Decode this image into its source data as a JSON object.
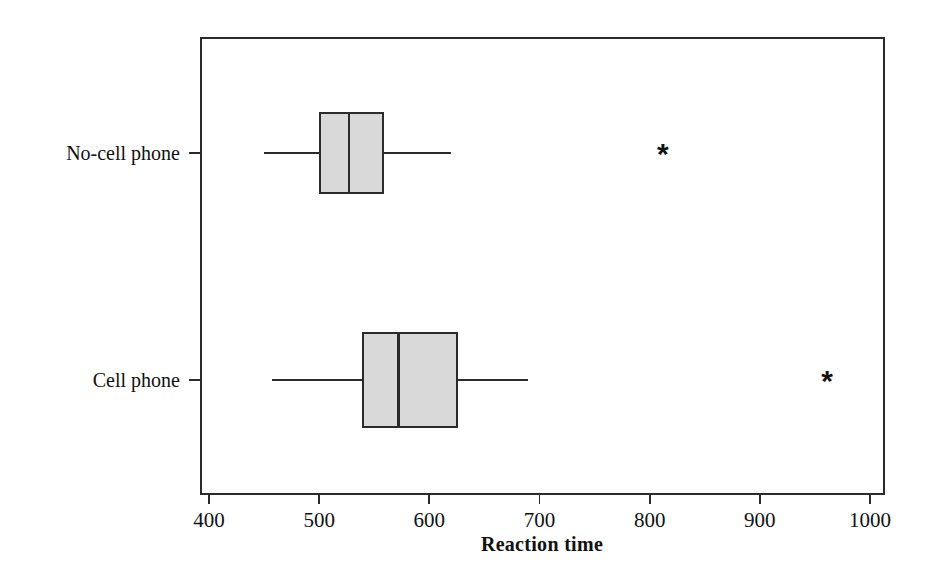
{
  "figure": {
    "background_color": "#ffffff",
    "box_fill_color": "#d9d9d9",
    "line_color": "#2b2b2b",
    "plot_frame": {
      "left": 201,
      "right": 884,
      "top": 38,
      "bottom": 494
    }
  },
  "axis": {
    "x_title": "Reaction time",
    "x_ticks": [
      "400",
      "500",
      "600",
      "700",
      "800",
      "900",
      "1000"
    ],
    "x_tick_values": [
      400,
      500,
      600,
      700,
      800,
      900,
      1000
    ],
    "x_min": 400,
    "x_max": 1000,
    "pixel_at_min": 209,
    "pixel_at_max": 870,
    "y_categories": [
      "No-cell phone",
      "Cell phone"
    ],
    "y_category_pixels": [
      153,
      380
    ],
    "grid": "off",
    "legend": "none"
  },
  "chart_data": {
    "type": "boxplot",
    "orientation": "horizontal",
    "title": "",
    "subtitle": "",
    "xlabel": "Reaction time",
    "ylabel": "",
    "xlim": [
      400,
      1000
    ],
    "grid": false,
    "legend_position": "none",
    "categories": [
      "No-cell phone",
      "Cell phone"
    ],
    "boxes": [
      {
        "category": "No-cell phone",
        "whisker_low": 450,
        "q1": 501,
        "median": 527,
        "q3": 558,
        "whisker_high": 620,
        "outliers": [
          812
        ],
        "row_pixel_center": 153,
        "box_half_height": 40
      },
      {
        "category": "Cell phone",
        "whisker_low": 457,
        "q1": 540,
        "median": 572,
        "q3": 625,
        "whisker_high": 690,
        "outliers": [
          961
        ],
        "row_pixel_center": 380,
        "box_half_height": 47
      }
    ],
    "outlier_symbol": "*"
  }
}
